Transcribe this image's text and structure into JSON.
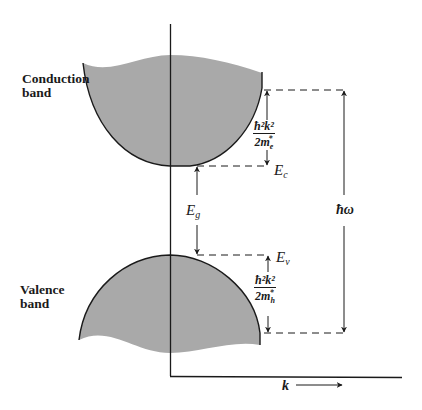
{
  "diagram": {
    "type": "semiconductor-band-diagram",
    "labels": {
      "conduction_band": "Conduction\nband",
      "valence_band": "Valence\nband",
      "conduction_edge": {
        "symbol": "E",
        "subscript": "c"
      },
      "valence_edge": {
        "symbol": "E",
        "subscript": "v"
      },
      "band_gap": {
        "symbol": "E",
        "subscript": "g"
      },
      "photon_energy": "ħω",
      "k_axis": "k",
      "electron_kinetic": {
        "numerator": "ħ²k²",
        "denominator_base": "2m",
        "denominator_sub": "e",
        "denominator_sup": "*"
      },
      "hole_kinetic": {
        "numerator": "ħ²k²",
        "denominator_base": "2m",
        "denominator_sub": "h",
        "denominator_sup": "*"
      }
    },
    "colors": {
      "band_fill": "#a9a9a9",
      "line": "#1a1a1a",
      "background": "#ffffff"
    }
  }
}
